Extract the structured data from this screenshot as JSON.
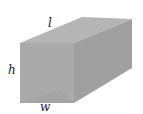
{
  "diagram": {
    "type": "rectangular-prism",
    "labels": {
      "length": "l",
      "height": "h",
      "width": "w"
    },
    "colors": {
      "front": "#a4a4a4",
      "top": "#b4b4b4",
      "side": "#9a9a9a"
    }
  }
}
